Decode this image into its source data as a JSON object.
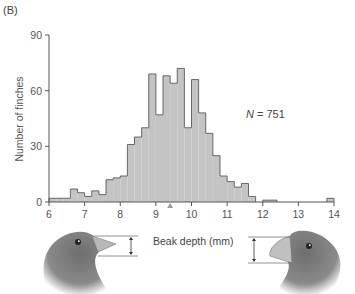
{
  "panel_label": "(B)",
  "annotation": {
    "symbol": "N",
    "text": " = 751"
  },
  "chart_data": {
    "type": "bar",
    "title": "",
    "panel": "(B)",
    "xlabel": "Beak depth (mm)",
    "ylabel": "Number of finches",
    "xlim": [
      6,
      14
    ],
    "ylim": [
      0,
      90
    ],
    "xticks": [
      6,
      7,
      8,
      9,
      10,
      11,
      12,
      13,
      14
    ],
    "yticks": [
      0,
      30,
      60,
      90
    ],
    "bin_width": 0.2,
    "bin_starts": [
      6.0,
      6.2,
      6.4,
      6.6,
      6.8,
      7.0,
      7.2,
      7.4,
      7.6,
      7.8,
      8.0,
      8.2,
      8.4,
      8.6,
      8.8,
      9.0,
      9.2,
      9.4,
      9.6,
      9.8,
      10.0,
      10.2,
      10.4,
      10.6,
      10.8,
      11.0,
      11.2,
      11.4,
      11.6,
      11.8,
      12.0,
      12.2,
      12.4,
      12.6,
      12.8,
      13.0,
      13.2,
      13.4,
      13.6,
      13.8
    ],
    "values": [
      2,
      2,
      2,
      7,
      5,
      3,
      6,
      4,
      12,
      13,
      14,
      31,
      35,
      40,
      69,
      47,
      68,
      64,
      72,
      40,
      66,
      48,
      37,
      25,
      14,
      11,
      8,
      10,
      3,
      0,
      1,
      1,
      0,
      0,
      0,
      0,
      0,
      0,
      0,
      2
    ],
    "mean_marker": 9.4,
    "annotations": [
      "N = 751"
    ],
    "grid": false,
    "legend": null
  },
  "x_axis_title": "Beak depth (mm)",
  "y_axis_title": "Number of finches",
  "colors": {
    "bar_fill": "#c4c4c4",
    "bar_edge": "#5a5a5a",
    "axis": "#555555",
    "marker": "#9a9a9a"
  }
}
